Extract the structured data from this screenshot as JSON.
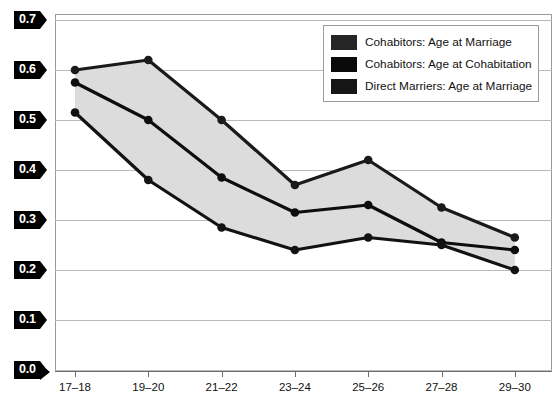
{
  "chart_data": {
    "type": "line",
    "title": "",
    "subtitle": "",
    "xlabel": "",
    "ylabel": "",
    "categories": [
      "17–18",
      "19–20",
      "21–22",
      "23–24",
      "25–26",
      "27–28",
      "29–30"
    ],
    "yticks": [
      "0.0",
      "0.1",
      "0.2",
      "0.3",
      "0.4",
      "0.5",
      "0.6",
      "0.7"
    ],
    "ylim": [
      0.0,
      0.7
    ],
    "grid": true,
    "legend_position": "top-right",
    "series": [
      {
        "name": "Cohabitors: Age at Marriage",
        "color": "#1a1a1a",
        "values": [
          0.6,
          0.62,
          0.5,
          0.37,
          0.42,
          0.325,
          0.265
        ]
      },
      {
        "name": "Cohabitors: Age at Cohabitation",
        "color": "#0d0d0d",
        "values": [
          0.575,
          0.5,
          0.385,
          0.315,
          0.33,
          0.255,
          0.24
        ]
      },
      {
        "name": "Direct Marriers: Age at Marriage",
        "color": "#121212",
        "values": [
          0.515,
          0.38,
          0.285,
          0.24,
          0.265,
          0.25,
          0.2
        ]
      }
    ],
    "band": {
      "description": "shaded gray region spanning between upper and lower series",
      "fill": "#dcdcdc"
    }
  },
  "legend": {
    "items": [
      {
        "label": "Cohabitors: Age at Marriage",
        "swatch": "#262626"
      },
      {
        "label": "Cohabitors: Age at Cohabitation",
        "swatch": "#0a0a0a"
      },
      {
        "label": "Direct Marriers: Age at Marriage",
        "swatch": "#151515"
      }
    ]
  },
  "axis": {
    "y_tag_bg": "#000000",
    "y_tag_fg": "#ffffff",
    "gridline_color": "#b9b9b9"
  }
}
